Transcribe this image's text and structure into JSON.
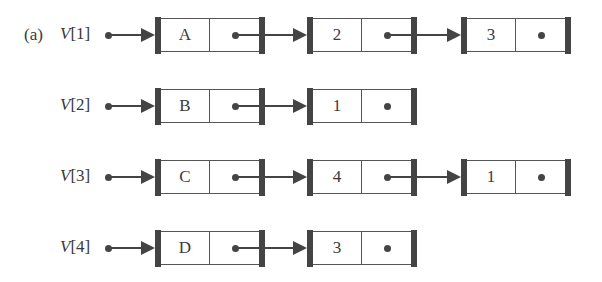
{
  "figure": {
    "label": "(a)",
    "vector_name": "V",
    "rows": [
      {
        "index_label": "[1]",
        "nodes": [
          "A",
          "2",
          "3"
        ]
      },
      {
        "index_label": "[2]",
        "nodes": [
          "B",
          "1"
        ]
      },
      {
        "index_label": "[3]",
        "nodes": [
          "C",
          "4",
          "1"
        ]
      },
      {
        "index_label": "[4]",
        "nodes": [
          "D",
          "3"
        ]
      }
    ]
  },
  "colors": {
    "ink": "#444444",
    "background": "#ffffff"
  }
}
